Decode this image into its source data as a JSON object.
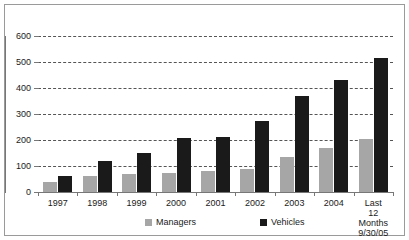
{
  "chart_data": {
    "type": "bar",
    "title": "",
    "subtitle": "",
    "xlabel": "",
    "ylabel": "",
    "ylim": [
      0,
      600
    ],
    "yticks": [
      0,
      100,
      200,
      300,
      400,
      500,
      600
    ],
    "grid": true,
    "legend_position": "bottom",
    "categories": [
      "1997",
      "1998",
      "1999",
      "2000",
      "2001",
      "2002",
      "2003",
      "2004",
      "Last\n12 Months\n9/30/05"
    ],
    "category_lines": [
      [
        "1997"
      ],
      [
        "1998"
      ],
      [
        "1999"
      ],
      [
        "2000"
      ],
      [
        "2001"
      ],
      [
        "2002"
      ],
      [
        "2003"
      ],
      [
        "2004"
      ],
      [
        "Last",
        "12 Months",
        "9/30/05"
      ]
    ],
    "series": [
      {
        "name": "Managers",
        "color": "#a6a6a6",
        "values": [
          40,
          62,
          68,
          73,
          80,
          87,
          133,
          170,
          202
        ]
      },
      {
        "name": "Vehicles",
        "color": "#1a1a1a",
        "values": [
          63,
          120,
          150,
          206,
          212,
          272,
          370,
          430,
          515
        ]
      }
    ]
  },
  "legend": {
    "items": [
      {
        "label": "Managers",
        "color": "#a6a6a6"
      },
      {
        "label": "Vehicles",
        "color": "#1a1a1a"
      }
    ]
  },
  "colors": {
    "managers": "#a6a6a6",
    "vehicles": "#1a1a1a",
    "grid": "#555555",
    "axis": "#777777",
    "frame": "#9a9a9a",
    "text": "#1a1a1a",
    "background": "#ffffff"
  }
}
